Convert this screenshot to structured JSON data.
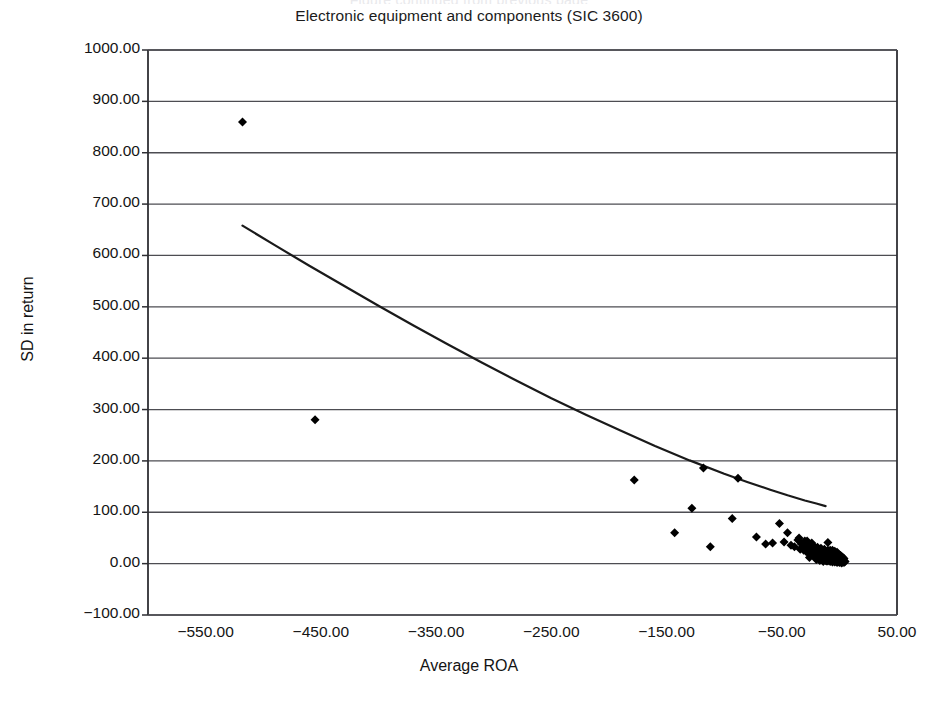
{
  "figure": {
    "clipped_caption": "Figure continued from previous page",
    "title": "Electronic equipment and components (SIC 3600)"
  },
  "chart_data": {
    "type": "scatter",
    "title": "Electronic equipment and components (SIC 3600)",
    "xlabel": "Average ROA",
    "ylabel": "SD in return",
    "xlim": [
      -600,
      50
    ],
    "ylim": [
      -100,
      1000
    ],
    "xticks": [
      -550,
      -450,
      -350,
      -250,
      -150,
      -50,
      50
    ],
    "xtick_labels": [
      "−550.00",
      "−450.00",
      "−350.00",
      "−250.00",
      "−150.00",
      "−50.00",
      "50.00"
    ],
    "yticks": [
      -100,
      0,
      100,
      200,
      300,
      400,
      500,
      600,
      700,
      800,
      900,
      1000
    ],
    "ytick_labels": [
      "−100.00",
      "0.00",
      "100.00",
      "200.00",
      "300.00",
      "400.00",
      "500.00",
      "600.00",
      "700.00",
      "800.00",
      "900.00",
      "1000.00"
    ],
    "grid": "horizontal",
    "legend": null,
    "marker": "diamond",
    "marker_color": "#000000",
    "marker_size": 9,
    "trendline": {
      "style": "solid",
      "color": "#1a1a1a",
      "width": 2.2,
      "description": "decreasing convex power/exponential fit",
      "points": [
        [
          -518,
          658
        ],
        [
          -490,
          620
        ],
        [
          -460,
          580
        ],
        [
          -430,
          541
        ],
        [
          -400,
          502
        ],
        [
          -370,
          464
        ],
        [
          -340,
          427
        ],
        [
          -310,
          391
        ],
        [
          -280,
          356
        ],
        [
          -250,
          322
        ],
        [
          -220,
          290
        ],
        [
          -190,
          259
        ],
        [
          -160,
          229
        ],
        [
          -130,
          201
        ],
        [
          -100,
          175
        ],
        [
          -80,
          159
        ],
        [
          -60,
          144
        ],
        [
          -45,
          133
        ],
        [
          -30,
          123
        ],
        [
          -20,
          117
        ],
        [
          -12,
          112
        ]
      ]
    },
    "points": [
      [
        -518,
        860
      ],
      [
        -455,
        280
      ],
      [
        -178,
        163
      ],
      [
        -118,
        186
      ],
      [
        -88,
        166
      ],
      [
        -128,
        108
      ],
      [
        -93,
        88
      ],
      [
        -143,
        60
      ],
      [
        -112,
        33
      ],
      [
        -72,
        52
      ],
      [
        -64,
        38
      ],
      [
        -58,
        40
      ],
      [
        -52,
        78
      ],
      [
        -48,
        42
      ],
      [
        -45,
        60
      ],
      [
        -42,
        36
      ],
      [
        -39,
        33
      ],
      [
        -36,
        46
      ],
      [
        -34,
        28
      ],
      [
        -32,
        30
      ],
      [
        -30,
        44
      ],
      [
        -29,
        24
      ],
      [
        -28,
        36
      ],
      [
        -27,
        20
      ],
      [
        -26,
        31
      ],
      [
        -25,
        18
      ],
      [
        -24,
        27
      ],
      [
        -23,
        22
      ],
      [
        -22,
        16
      ],
      [
        -21,
        25
      ],
      [
        -21,
        12
      ],
      [
        -20,
        20
      ],
      [
        -20,
        30
      ],
      [
        -19,
        15
      ],
      [
        -19,
        24
      ],
      [
        -18,
        10
      ],
      [
        -18,
        19
      ],
      [
        -17,
        26
      ],
      [
        -17,
        14
      ],
      [
        -16,
        8
      ],
      [
        -16,
        18
      ],
      [
        -16,
        23
      ],
      [
        -15,
        12
      ],
      [
        -15,
        20
      ],
      [
        -14,
        7
      ],
      [
        -14,
        16
      ],
      [
        -14,
        22
      ],
      [
        -13,
        10
      ],
      [
        -13,
        18
      ],
      [
        -13,
        25
      ],
      [
        -12,
        6
      ],
      [
        -12,
        14
      ],
      [
        -12,
        20
      ],
      [
        -11,
        9
      ],
      [
        -11,
        16
      ],
      [
        -11,
        23
      ],
      [
        -10,
        5
      ],
      [
        -10,
        12
      ],
      [
        -10,
        18
      ],
      [
        -10,
        41
      ],
      [
        -9,
        8
      ],
      [
        -9,
        14
      ],
      [
        -9,
        21
      ],
      [
        -8,
        4
      ],
      [
        -8,
        11
      ],
      [
        -8,
        17
      ],
      [
        -8,
        26
      ],
      [
        -7,
        7
      ],
      [
        -7,
        13
      ],
      [
        -7,
        19
      ],
      [
        -6,
        3
      ],
      [
        -6,
        9
      ],
      [
        -6,
        15
      ],
      [
        -6,
        22
      ],
      [
        -5,
        6
      ],
      [
        -5,
        11
      ],
      [
        -5,
        17
      ],
      [
        -4,
        3
      ],
      [
        -4,
        8
      ],
      [
        -4,
        13
      ],
      [
        -4,
        19
      ],
      [
        -3,
        5
      ],
      [
        -3,
        10
      ],
      [
        -3,
        15
      ],
      [
        -2,
        2
      ],
      [
        -2,
        7
      ],
      [
        -2,
        12
      ],
      [
        -2,
        17
      ],
      [
        -1,
        4
      ],
      [
        -1,
        9
      ],
      [
        -1,
        14
      ],
      [
        0,
        2
      ],
      [
        0,
        6
      ],
      [
        0,
        11
      ],
      [
        1,
        3
      ],
      [
        1,
        8
      ],
      [
        1,
        13
      ],
      [
        2,
        1
      ],
      [
        2,
        5
      ],
      [
        2,
        10
      ],
      [
        3,
        3
      ],
      [
        3,
        7
      ],
      [
        4,
        2
      ],
      [
        4,
        6
      ],
      [
        5,
        4
      ],
      [
        -35,
        50
      ],
      [
        -33,
        38
      ],
      [
        -31,
        26
      ],
      [
        -28,
        44
      ],
      [
        -26,
        12
      ],
      [
        -24,
        40
      ],
      [
        -22,
        34
      ],
      [
        -20,
        8
      ],
      [
        -19,
        32
      ],
      [
        -18,
        28
      ],
      [
        -17,
        6
      ],
      [
        -16,
        30
      ],
      [
        -15,
        26
      ],
      [
        -14,
        4
      ],
      [
        -13,
        28
      ],
      [
        -12,
        24
      ],
      [
        -11,
        5
      ],
      [
        -10,
        26
      ],
      [
        -9,
        24
      ],
      [
        -8,
        22
      ],
      [
        -7,
        24
      ],
      [
        -6,
        26
      ],
      [
        -5,
        22
      ],
      [
        -4,
        24
      ],
      [
        -3,
        20
      ],
      [
        -2,
        22
      ],
      [
        -1,
        19
      ],
      [
        0,
        17
      ],
      [
        1,
        16
      ],
      [
        2,
        14
      ],
      [
        3,
        12
      ],
      [
        4,
        10
      ]
    ]
  }
}
